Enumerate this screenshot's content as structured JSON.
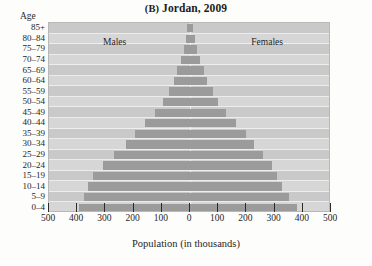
{
  "figure": {
    "panel_letter": "(B)",
    "title_text": "Jordan, 2009",
    "age_axis_label": "Age",
    "x_axis_title": "Population (in thousands)",
    "males_label": "Males",
    "females_label": "Females"
  },
  "colors": {
    "bar": "#9b9b9b",
    "plot_background": "#cfcfcf",
    "band_alt": "#d6d6d6",
    "grid_line": "#f2f2f0",
    "text": "#1f1f1f"
  },
  "chart_data": {
    "type": "bar",
    "subtype": "population-pyramid",
    "title": "(B) Jordan, 2009",
    "xlabel": "Population (in thousands)",
    "ylabel": "Age",
    "orientation": "horizontal",
    "grid": true,
    "legend_position": "inside-top",
    "xlim": [
      -500,
      500
    ],
    "xticks": [
      -500,
      -400,
      -300,
      -200,
      -100,
      0,
      100,
      200,
      300,
      400,
      500
    ],
    "xtick_labels": [
      "500",
      "400",
      "300",
      "200",
      "100",
      "0",
      "100",
      "200",
      "300",
      "400",
      "500"
    ],
    "categories": [
      "85+",
      "80-84",
      "75-79",
      "70-74",
      "65-69",
      "60-64",
      "55-59",
      "50-54",
      "45-49",
      "40-44",
      "35-39",
      "30-34",
      "25-29",
      "20-24",
      "15-19",
      "10-14",
      "5-9",
      "0-4"
    ],
    "series": [
      {
        "name": "Males",
        "side": "left",
        "values": [
          9,
          14,
          21,
          33,
          45,
          58,
          75,
          96,
          123,
          158,
          196,
          228,
          268,
          310,
          345,
          362,
          375,
          395
        ]
      },
      {
        "name": "Females",
        "side": "right",
        "values": [
          11,
          16,
          24,
          36,
          48,
          62,
          80,
          101,
          129,
          162,
          199,
          227,
          260,
          291,
          310,
          326,
          352,
          378
        ]
      }
    ]
  }
}
